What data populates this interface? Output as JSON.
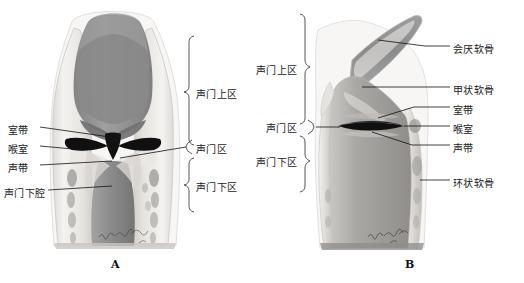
{
  "figure": {
    "background": "#ffffff",
    "ink_color": "#1a1a1a"
  },
  "panels": [
    {
      "letter": "A",
      "view": "coronal",
      "left_labels": [
        {
          "text": "室带",
          "y": 128
        },
        {
          "text": "喉室",
          "y": 147
        },
        {
          "text": "声带",
          "y": 166
        },
        {
          "text": "声门下腔",
          "y": 191
        }
      ],
      "right_labels": [
        {
          "text": "声门上区",
          "y": 92
        },
        {
          "text": "声门区",
          "y": 147
        },
        {
          "text": "声门下区",
          "y": 185
        }
      ]
    },
    {
      "letter": "B",
      "view": "sagittal",
      "left_labels": [
        {
          "text": "声门上区",
          "y": 68
        },
        {
          "text": "声门区",
          "y": 126
        },
        {
          "text": "声门下区",
          "y": 160
        }
      ],
      "right_labels": [
        {
          "text": "会厌软骨",
          "y": 47
        },
        {
          "text": "甲状软骨",
          "y": 88
        },
        {
          "text": "室带",
          "y": 108
        },
        {
          "text": "喉室",
          "y": 127
        },
        {
          "text": "声带",
          "y": 146
        },
        {
          "text": "环状软骨",
          "y": 181
        }
      ]
    }
  ],
  "colors": {
    "cartilage_light": "#eceae7",
    "cartilage_mid": "#d2cfcb",
    "mucosa_dark": "#8d8d8d",
    "mucosa_mid": "#a9a8a6",
    "cavity_black": "#141414",
    "outline": "#b9b6b2"
  },
  "signature": {
    "text": "artist-signature",
    "panel_a": {
      "x": 100,
      "y": 240
    },
    "panel_b": {
      "x": 370,
      "y": 240
    }
  }
}
